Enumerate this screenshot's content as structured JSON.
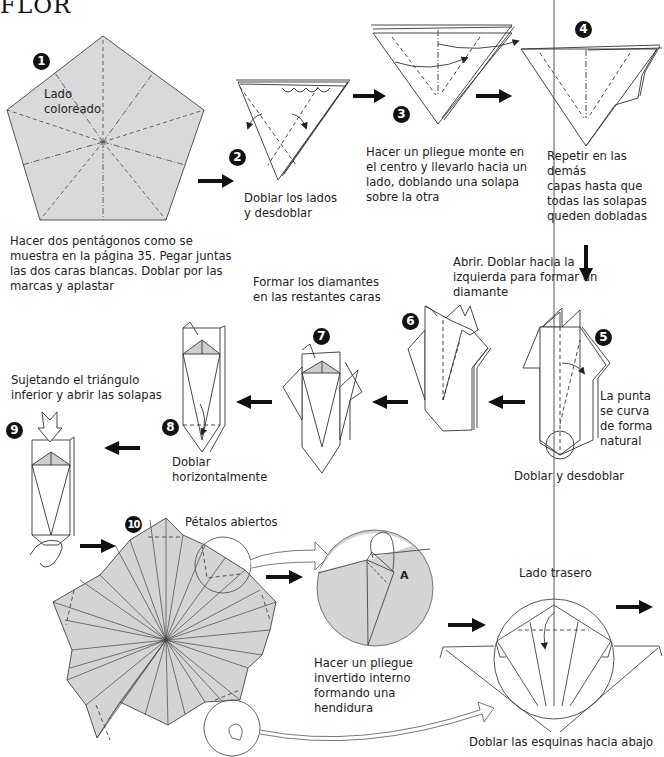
{
  "title": "FLOR",
  "colors": {
    "paper_colored": "#d9d9d9",
    "line": "#333333",
    "arrow": "#111111",
    "background": "#ffffff"
  },
  "steps": [
    {
      "number": "1",
      "label": "Lado\ncoloreado",
      "caption": "Hacer dos pentágonos como se\nmuestra en la página 35. Pegar juntas\nlas dos caras blancas. Doblar por las\nmarcas y aplastar"
    },
    {
      "number": "2",
      "caption": "Doblar los lados\ny desdoblar"
    },
    {
      "number": "3",
      "caption": "Hacer un pliegue monte en\nel centro y llevarlo hacia un\nlado, doblando una solapa\nsobre la otra"
    },
    {
      "number": "4",
      "caption": "Repetir en las demás\ncapas hasta que\ntodas las solapas\nqueden dobladas"
    },
    {
      "number": "5",
      "note": "La punta\nse curva\nde forma\nnatural",
      "caption": "Doblar y desdoblar"
    },
    {
      "number": "6",
      "caption": "Abrir. Doblar hacia la\nizquierda para formar un\ndiamante"
    },
    {
      "number": "7",
      "caption": "Formar los diamantes\nen las restantes caras"
    },
    {
      "number": "8",
      "caption": "Doblar\nhorizontalmente"
    },
    {
      "number": "9",
      "caption": "Sujetando el triángulo\ninferior y abrir las solapas"
    },
    {
      "number": "10",
      "label": "Pétalos abiertos"
    }
  ],
  "details": {
    "inside_reverse_fold": {
      "point_label": "A",
      "caption": "Hacer un pliegue\ninvertido interno\nformando una\nhendidura"
    },
    "back_side": {
      "label": "Lado trasero",
      "caption": "Doblar las esquinas hacia abajo"
    }
  }
}
